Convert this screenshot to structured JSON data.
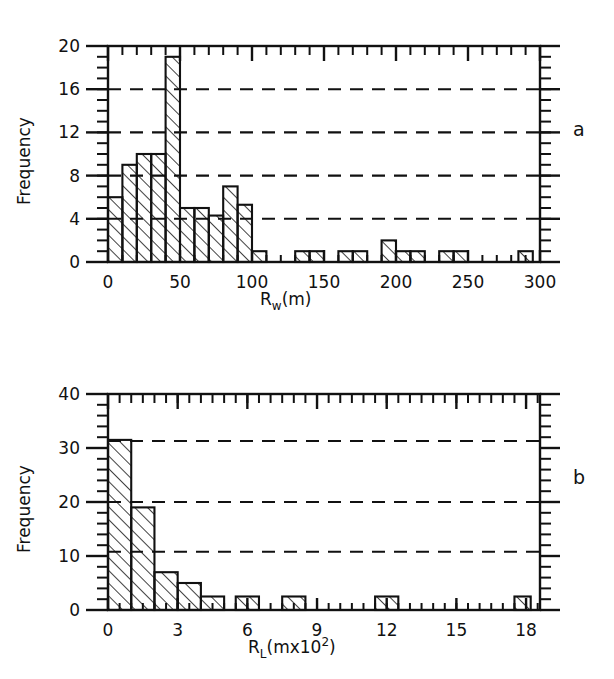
{
  "figure": {
    "background_color": "#ffffff",
    "ink_color": "#111111",
    "panels": [
      {
        "letter": "a",
        "chart_index": 0
      },
      {
        "letter": "b",
        "chart_index": 1
      }
    ]
  },
  "chart_data": [
    {
      "type": "bar",
      "subtype": "histogram",
      "panel_label": "a",
      "title": "",
      "xlabel_parts": {
        "base": "R",
        "subscript": "w",
        "tail": "(m)"
      },
      "xlabel": "R_w(m)",
      "ylabel": "Frequency",
      "xlim": [
        0,
        300
      ],
      "ylim": [
        0,
        20
      ],
      "x_major_ticks": [
        0,
        50,
        100,
        150,
        200,
        250,
        300
      ],
      "x_tick_labels": [
        "0",
        "50",
        "100",
        "150",
        "200",
        "250",
        "300"
      ],
      "x_minor_tick_step": 10,
      "y_major_ticks": [
        0,
        4,
        8,
        12,
        16,
        20
      ],
      "y_tick_labels": [
        "0",
        "4",
        "8",
        "12",
        "16",
        "20"
      ],
      "y_minor_tick_step": 1,
      "grid": "horizontal-dashed",
      "gridlines_y": [
        4,
        8,
        12,
        16
      ],
      "bin_width": 10,
      "bar_fill": "diagonal-hatch",
      "bins": [
        {
          "x0": 0,
          "x1": 10,
          "value": 6
        },
        {
          "x0": 10,
          "x1": 20,
          "value": 9
        },
        {
          "x0": 20,
          "x1": 30,
          "value": 10
        },
        {
          "x0": 30,
          "x1": 40,
          "value": 10
        },
        {
          "x0": 40,
          "x1": 50,
          "value": 19
        },
        {
          "x0": 50,
          "x1": 60,
          "value": 5
        },
        {
          "x0": 60,
          "x1": 70,
          "value": 5
        },
        {
          "x0": 70,
          "x1": 80,
          "value": 4.3
        },
        {
          "x0": 80,
          "x1": 90,
          "value": 7
        },
        {
          "x0": 90,
          "x1": 100,
          "value": 5.3
        },
        {
          "x0": 100,
          "x1": 110,
          "value": 1
        },
        {
          "x0": 130,
          "x1": 140,
          "value": 1
        },
        {
          "x0": 140,
          "x1": 150,
          "value": 1
        },
        {
          "x0": 160,
          "x1": 170,
          "value": 1
        },
        {
          "x0": 170,
          "x1": 180,
          "value": 1
        },
        {
          "x0": 190,
          "x1": 200,
          "value": 2
        },
        {
          "x0": 200,
          "x1": 210,
          "value": 1
        },
        {
          "x0": 210,
          "x1": 220,
          "value": 1
        },
        {
          "x0": 230,
          "x1": 240,
          "value": 1
        },
        {
          "x0": 240,
          "x1": 250,
          "value": 1
        },
        {
          "x0": 285,
          "x1": 295,
          "value": 1
        }
      ],
      "categories": [
        "0-10",
        "10-20",
        "20-30",
        "30-40",
        "40-50",
        "50-60",
        "60-70",
        "70-80",
        "80-90",
        "90-100",
        "100-110",
        "130-140",
        "140-150",
        "160-170",
        "170-180",
        "190-200",
        "200-210",
        "210-220",
        "230-240",
        "240-250",
        "285-295"
      ],
      "values": [
        6,
        9,
        10,
        10,
        19,
        5,
        5,
        4.3,
        7,
        5.3,
        1,
        1,
        1,
        1,
        1,
        2,
        1,
        1,
        1,
        1,
        1
      ]
    },
    {
      "type": "bar",
      "subtype": "histogram",
      "panel_label": "b",
      "title": "",
      "xlabel_parts": {
        "base": "R",
        "subscript": "L",
        "tail": "(mx10",
        "superscript": "2",
        "tail2": ")"
      },
      "xlabel": "R_L(mx10^2)",
      "ylabel": "Frequency",
      "xlim": [
        0,
        18.6
      ],
      "ylim": [
        0,
        40
      ],
      "x_major_ticks": [
        0,
        3,
        6,
        9,
        12,
        15,
        18
      ],
      "x_tick_labels": [
        "0",
        "3",
        "6",
        "9",
        "12",
        "15",
        "18"
      ],
      "x_minor_tick_step": 0.5,
      "y_major_ticks": [
        0,
        10,
        20,
        30,
        40
      ],
      "y_tick_labels": [
        "0",
        "10",
        "20",
        "30",
        "40"
      ],
      "y_minor_tick_step": 2,
      "grid": "horizontal-dashed",
      "gridlines_y": [
        10.8,
        20,
        31.3
      ],
      "bin_width": 1,
      "bar_fill": "diagonal-hatch",
      "bins": [
        {
          "x0": 0,
          "x1": 1,
          "value": 31.5
        },
        {
          "x0": 1,
          "x1": 2,
          "value": 19
        },
        {
          "x0": 2,
          "x1": 3,
          "value": 7
        },
        {
          "x0": 3,
          "x1": 4,
          "value": 5
        },
        {
          "x0": 4,
          "x1": 5,
          "value": 2.5
        },
        {
          "x0": 5.5,
          "x1": 6.5,
          "value": 2.5
        },
        {
          "x0": 7.5,
          "x1": 8.5,
          "value": 2.5
        },
        {
          "x0": 11.5,
          "x1": 12.5,
          "value": 2.5
        },
        {
          "x0": 17.5,
          "x1": 18.2,
          "value": 2.5
        }
      ],
      "categories": [
        "0-1",
        "1-2",
        "2-3",
        "3-4",
        "4-5",
        "5.5-6.5",
        "7.5-8.5",
        "11.5-12.5",
        "17.5-18.2"
      ],
      "values": [
        31.5,
        19,
        7,
        5,
        2.5,
        2.5,
        2.5,
        2.5,
        2.5
      ]
    }
  ]
}
